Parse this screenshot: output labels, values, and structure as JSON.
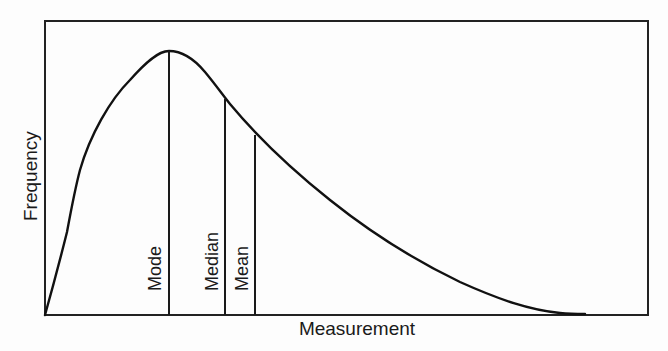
{
  "diagram": {
    "title": "",
    "type": "right-skewed frequency distribution",
    "x_axis_label": "Measurement",
    "y_axis_label": "Frequency",
    "markers": [
      {
        "id": "mode",
        "label": "Mode",
        "x": 169,
        "top_y": 51
      },
      {
        "id": "median",
        "label": "Median",
        "x": 225,
        "top_y": 99
      },
      {
        "id": "mean",
        "label": "Mean",
        "x": 255,
        "top_y": 135
      }
    ],
    "colors": {
      "line": "#111111",
      "background": "#fdfdfd"
    }
  }
}
